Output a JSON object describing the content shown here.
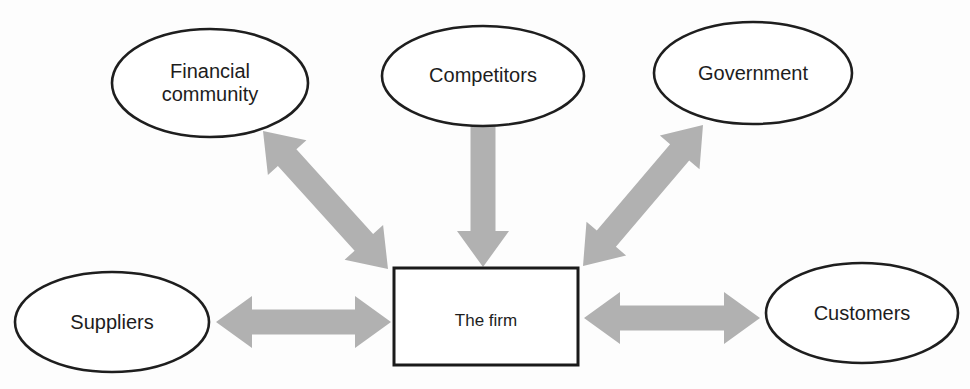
{
  "diagram": {
    "title": "",
    "colors": {
      "arrow": "#b1b1b1",
      "node_border": "#1e1e1e",
      "node_fill": "#ffffff",
      "background": "#fdfdfd",
      "text": "#1d1d1d"
    },
    "nodes": {
      "financial_community": {
        "label": "Financial community",
        "shape": "ellipse"
      },
      "competitors": {
        "label": "Competitors",
        "shape": "ellipse"
      },
      "government": {
        "label": "Government",
        "shape": "ellipse"
      },
      "suppliers": {
        "label": "Suppliers",
        "shape": "ellipse"
      },
      "customers": {
        "label": "Customers",
        "shape": "ellipse"
      },
      "firm": {
        "label": "The firm",
        "shape": "rectangle"
      }
    },
    "edges": [
      {
        "id": "financial-community-firm",
        "from_node": "financial_community",
        "to_node": "firm",
        "direction": "bidirectional",
        "from": [
          263,
          131
        ],
        "to": [
          388,
          269
        ],
        "heads": "both"
      },
      {
        "id": "competitors-firm",
        "from_node": "competitors",
        "to_node": "firm",
        "direction": "one-way",
        "from": [
          483,
          126
        ],
        "to": [
          483,
          267
        ],
        "heads": "end"
      },
      {
        "id": "government-firm",
        "from_node": "government",
        "to_node": "firm",
        "direction": "bidirectional",
        "from": [
          583,
          266
        ],
        "to": [
          703,
          125
        ],
        "heads": "both"
      },
      {
        "id": "suppliers-firm",
        "from_node": "suppliers",
        "to_node": "firm",
        "direction": "bidirectional",
        "from": [
          216,
          322
        ],
        "to": [
          391,
          322
        ],
        "heads": "both"
      },
      {
        "id": "firm-customers",
        "from_node": "firm",
        "to_node": "customers",
        "direction": "bidirectional",
        "from": [
          584,
          318
        ],
        "to": [
          760,
          318
        ],
        "heads": "both"
      }
    ],
    "arrow_style": {
      "shaft_half_width": 12.5,
      "head_length": 36,
      "head_half_width": 26
    }
  }
}
